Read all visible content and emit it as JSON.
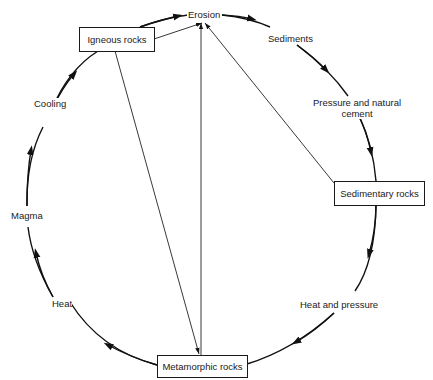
{
  "diagram": {
    "nodes": {
      "igneous": "Igneous rocks",
      "sedimentary": "Sedimentary rocks",
      "metamorphic": "Metamorphic rocks"
    },
    "process_labels": {
      "erosion": "Erosion",
      "sediments": "Sediments",
      "pressure_cement_line1": "Pressure and natural",
      "pressure_cement_line2": "cement",
      "heat_and_pressure": "Heat and pressure",
      "heat": "Heat",
      "magma": "Magma",
      "cooling": "Cooling"
    },
    "edges": [
      {
        "from": "Igneous rocks",
        "to": "Erosion",
        "type": "arc-clockwise"
      },
      {
        "from": "Erosion",
        "to": "Sedimentary rocks",
        "type": "arc-clockwise",
        "via": [
          "Sediments",
          "Pressure and natural cement"
        ]
      },
      {
        "from": "Sedimentary rocks",
        "to": "Metamorphic rocks",
        "type": "arc-clockwise",
        "via": [
          "Heat and pressure"
        ]
      },
      {
        "from": "Metamorphic rocks",
        "to": "Igneous rocks",
        "type": "arc-clockwise",
        "via": [
          "Heat",
          "Magma",
          "Cooling"
        ]
      },
      {
        "from": "Igneous rocks",
        "to": "Erosion",
        "type": "straight-arrow"
      },
      {
        "from": "Sedimentary rocks",
        "to": "Erosion",
        "type": "straight-arrow"
      },
      {
        "from": "Metamorphic rocks",
        "to": "Erosion",
        "type": "straight-arrow"
      },
      {
        "from": "Igneous rocks",
        "to": "Metamorphic rocks",
        "type": "straight-arrow"
      }
    ]
  }
}
